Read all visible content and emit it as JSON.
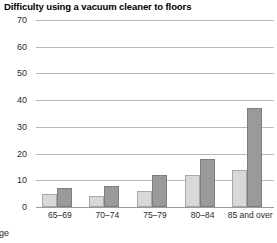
{
  "chart_data": {
    "type": "bar",
    "title": "Difficulty using a vacuum cleaner to floors",
    "xlabel": "Age",
    "ylabel": "",
    "categories": [
      "65–69",
      "70–74",
      "75–79",
      "80–84",
      "85 and over"
    ],
    "series": [
      {
        "name": "series-1",
        "color": "#d8d8d8",
        "values": [
          5,
          4,
          6,
          12,
          14
        ]
      },
      {
        "name": "series-2",
        "color": "#9a9a9a",
        "values": [
          7,
          8,
          12,
          18,
          37
        ]
      }
    ],
    "ylim": [
      0,
      70
    ],
    "ytick_values": [
      0,
      10,
      20,
      30,
      40,
      50,
      60,
      70
    ],
    "ytick_labels": [
      "0",
      "10",
      "20",
      "30",
      "40",
      "50",
      "60",
      "70"
    ],
    "grid": true,
    "legend": "none",
    "orientation": "vertical",
    "grouping": "clustered"
  }
}
